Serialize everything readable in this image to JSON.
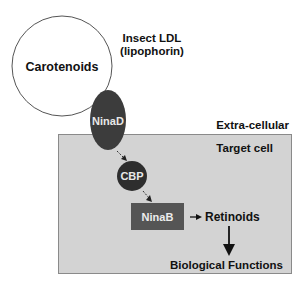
{
  "diagram": {
    "lipoprotein": {
      "label_line1": "Insect LDL",
      "label_line2": "(lipophorin)",
      "content": "Carotenoids"
    },
    "receptor": "NinaD",
    "extracellular_label": "Extra-cellular",
    "cell_label": "Target cell",
    "binding_protein": "CBP",
    "enzyme": "NinaB",
    "product": "Retinoids",
    "outcome": "Biological Functions"
  },
  "colors": {
    "cell_fill": "#d3d3d3",
    "cell_border": "#8a8a8a",
    "ninad": "#3c3c3c",
    "cbp": "#2e2e2e",
    "ninab": "#555555",
    "lipoprotein_fill": "#ffffff",
    "text": "#111111"
  }
}
